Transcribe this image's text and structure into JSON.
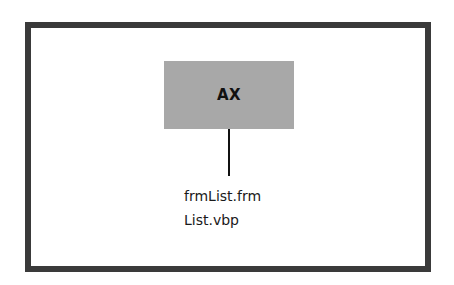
{
  "diagram": {
    "node": {
      "label": "AX",
      "fill": "#a8a8a8"
    },
    "files": [
      "frmList.frm",
      "List.vbp"
    ],
    "frame_color": "#3a3a3a"
  }
}
